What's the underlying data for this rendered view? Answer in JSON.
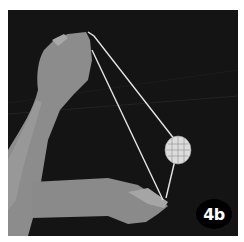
{
  "photo": {
    "description": "Black and white photo of two hands holding a string loop with a round patterned disc, demonstrating a string trick step",
    "colors": {
      "background": "#141414",
      "skin": "#9a9a9a",
      "string": "#e6e6e6",
      "disc": "#d8d8d8"
    }
  },
  "badge": {
    "label": "4b"
  }
}
